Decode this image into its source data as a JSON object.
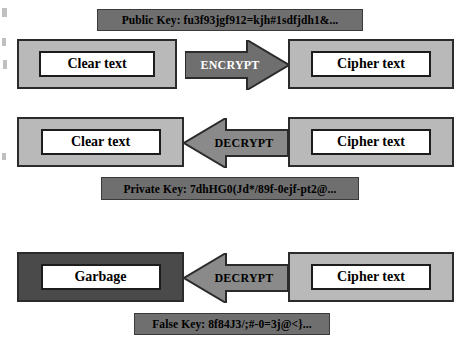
{
  "diagram": {
    "colors": {
      "banner_fill": "#6f6f6f",
      "box_light_fill": "#b9b9b9",
      "box_dark_fill": "#4a4a4a",
      "inner_fill": "#ffffff",
      "arrow_fill": "#6f6f6f",
      "border": "#2b2b2b",
      "background": "#ffffff"
    },
    "rows": [
      {
        "id": "encrypt-row",
        "banner": {
          "name": "public-key-banner",
          "label": "Public Key: fu3f93jgf912=kjh#1sdfjdh1&..."
        },
        "source": {
          "name": "clear-text-box-encrypt",
          "label": "Clear text",
          "shade": "light"
        },
        "arrow": {
          "name": "encrypt-arrow",
          "label": "ENCRYPT",
          "direction": "right",
          "label_color": "white"
        },
        "target": {
          "name": "cipher-text-box-encrypt",
          "label": "Cipher text",
          "shade": "light"
        }
      },
      {
        "id": "decrypt-row",
        "banner": {
          "name": "private-key-banner",
          "label": "Private Key: 7dhHG0(Jd*/89f-0ejf-pt2@..."
        },
        "source": {
          "name": "cipher-text-box-decrypt",
          "label": "Cipher text",
          "shade": "light"
        },
        "arrow": {
          "name": "decrypt-arrow",
          "label": "DECRYPT",
          "direction": "left",
          "label_color": "black"
        },
        "target": {
          "name": "clear-text-box-decrypt",
          "label": "Clear text",
          "shade": "light"
        }
      },
      {
        "id": "false-decrypt-row",
        "banner": {
          "name": "false-key-banner",
          "label": "False Key: 8f84J3/;#-0=3j@<}..."
        },
        "source": {
          "name": "cipher-text-box-false",
          "label": "Cipher text",
          "shade": "light"
        },
        "arrow": {
          "name": "false-decrypt-arrow",
          "label": "DECRYPT",
          "direction": "left",
          "label_color": "black"
        },
        "target": {
          "name": "garbage-box",
          "label": "Garbage",
          "shade": "dark"
        }
      }
    ]
  }
}
